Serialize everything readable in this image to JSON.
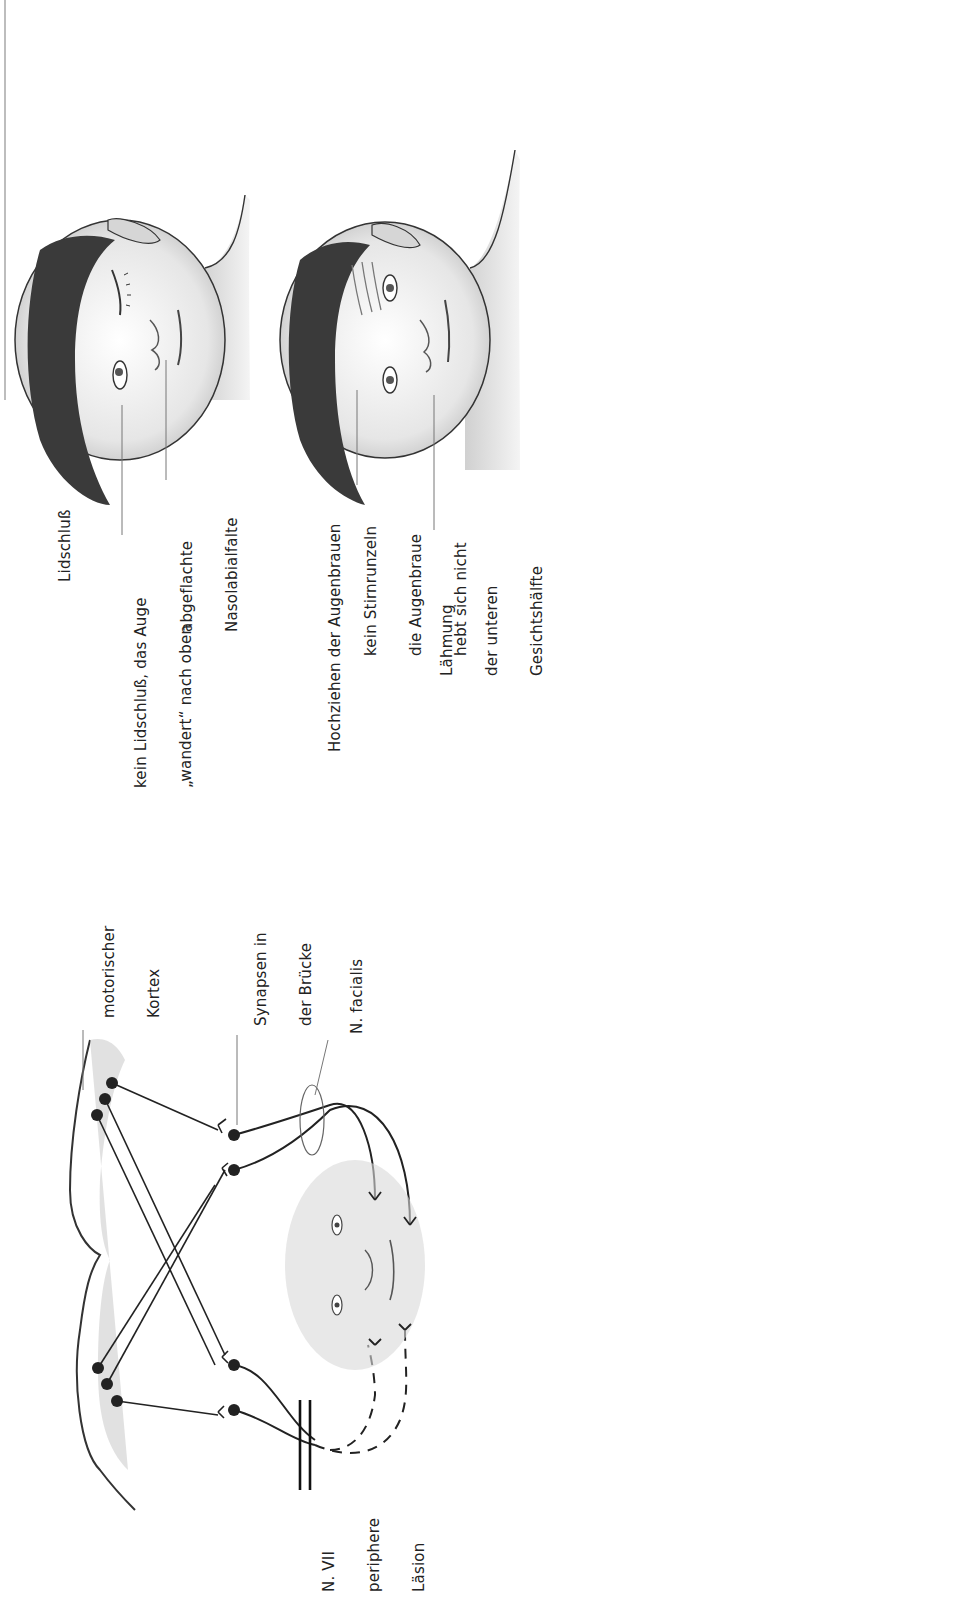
{
  "figure": {
    "orientation": "rotated-90-ccw",
    "panels": {
      "top_face_eyes_closed": {
        "heading": "Lidschluß",
        "callouts": [
          {
            "lines": [
              "kein Lidschluß, das Auge",
              "„wandert“ nach oben"
            ]
          },
          {
            "lines": [
              "abgeflachte",
              "Nasolabialfalte"
            ]
          }
        ]
      },
      "bottom_face_brows_raised": {
        "heading": "Hochziehen der Augenbrauen",
        "callouts": [
          {
            "lines": [
              "kein Stirnrunzeln",
              "die Augenbraue",
              "hebt sich nicht"
            ]
          },
          {
            "lines": [
              "Lähmung",
              "der unteren",
              "Gesichtshälfte"
            ]
          }
        ]
      },
      "pathway_diagram": {
        "labels": {
          "motor_cortex": [
            "motorischer",
            "Kortex"
          ],
          "pons_synapses": [
            "Synapsen in",
            "der Brücke"
          ],
          "facial_nerve": [
            "N. facialis"
          ],
          "lesion": [
            "N. VII",
            "periphere",
            "Läsion"
          ]
        }
      }
    },
    "colors": {
      "line": "#1a1a1a",
      "shading": "#9a9a9a",
      "hair": "#3a3a3a",
      "leader": "#777777",
      "page_edge": "#bdbdbd"
    }
  }
}
